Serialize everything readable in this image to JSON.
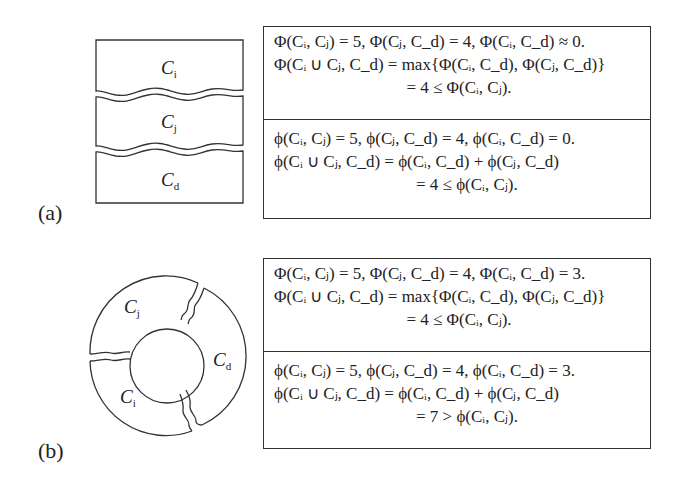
{
  "figure": {
    "panel_a": {
      "label": "(a)",
      "regions": [
        {
          "name": "C_i",
          "text": "C",
          "sub": "i"
        },
        {
          "name": "C_j",
          "text": "C",
          "sub": "j"
        },
        {
          "name": "C_d",
          "text": "C",
          "sub": "d"
        }
      ],
      "max_box": {
        "line1": "Φ(Cᵢ, Cⱼ) = 5, Φ(Cⱼ, C_d) = 4, Φ(Cᵢ, C_d) ≈ 0.",
        "line2": "Φ(Cᵢ ∪ Cⱼ, C_d) = max{Φ(Cᵢ, C_d), Φ(Cⱼ, C_d)}",
        "line3": "= 4 ≤ Φ(Cᵢ, Cⱼ)."
      },
      "sum_box": {
        "line1": "ϕ(Cᵢ, Cⱼ) = 5, ϕ(Cⱼ, C_d) = 4, ϕ(Cᵢ, C_d) = 0.",
        "line2": "ϕ(Cᵢ ∪ Cⱼ, C_d) = ϕ(Cᵢ, C_d) + ϕ(Cⱼ, C_d)",
        "line3": "= 4 ≤ ϕ(Cᵢ, Cⱼ)."
      }
    },
    "panel_b": {
      "label": "(b)",
      "regions": [
        {
          "name": "C_j",
          "text": "C",
          "sub": "j"
        },
        {
          "name": "C_d",
          "text": "C",
          "sub": "d"
        },
        {
          "name": "C_i",
          "text": "C",
          "sub": "i"
        }
      ],
      "max_box": {
        "line1": "Φ(Cᵢ, Cⱼ) = 5, Φ(Cⱼ, C_d) = 4, Φ(Cᵢ, C_d) = 3.",
        "line2": "Φ(Cᵢ ∪ Cⱼ, C_d) = max{Φ(Cᵢ, C_d), Φ(Cⱼ, C_d)}",
        "line3": "= 4 ≤ Φ(Cᵢ, Cⱼ)."
      },
      "sum_box": {
        "line1": "ϕ(Cᵢ, Cⱼ) = 5, ϕ(Cⱼ, C_d) = 4, ϕ(Cᵢ, C_d) = 3.",
        "line2": "ϕ(Cᵢ ∪ Cⱼ, C_d) = ϕ(Cᵢ, C_d) + ϕ(Cⱼ, C_d)",
        "line3": "= 7 > ϕ(Cᵢ, Cⱼ)."
      }
    }
  }
}
